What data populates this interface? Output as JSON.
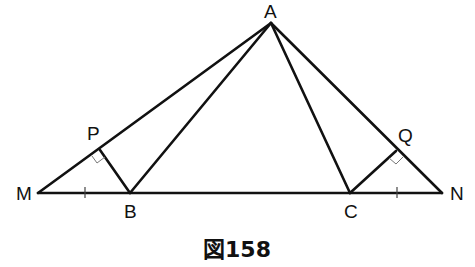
{
  "figure": {
    "caption": "図158",
    "points": {
      "A": {
        "label": "A",
        "x": 271,
        "y": 23
      },
      "M": {
        "label": "M",
        "x": 38,
        "y": 193
      },
      "N": {
        "label": "N",
        "x": 442,
        "y": 193
      },
      "B": {
        "label": "B",
        "x": 130,
        "y": 193
      },
      "C": {
        "label": "C",
        "x": 350,
        "y": 193
      },
      "P": {
        "label": "P",
        "x": 100,
        "y": 150
      },
      "Q": {
        "label": "Q",
        "x": 396,
        "y": 151
      }
    },
    "segments": [
      "AM",
      "AN",
      "MN",
      "AB",
      "AC",
      "BP",
      "CQ"
    ],
    "right_angles": [
      "P",
      "Q"
    ],
    "equal_ticks": [
      "MB",
      "CN"
    ]
  }
}
